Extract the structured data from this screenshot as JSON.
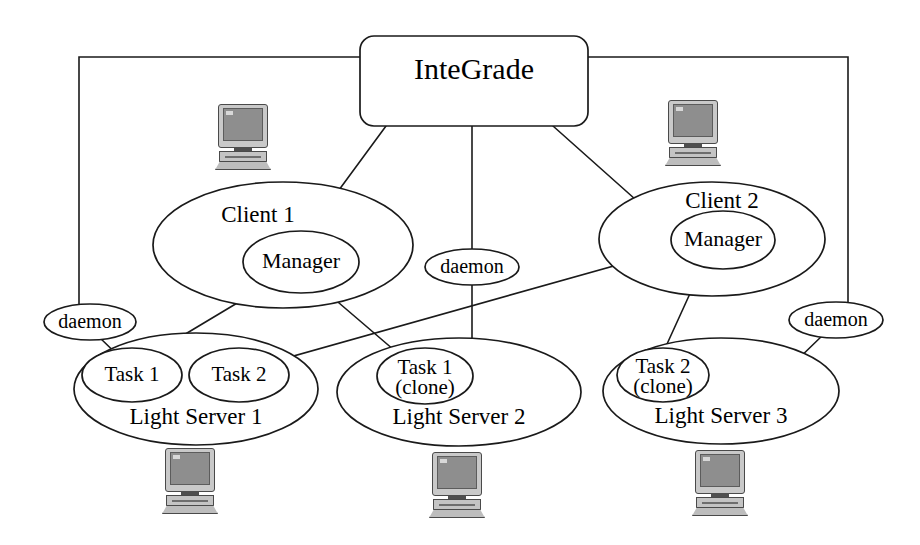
{
  "diagram": {
    "title": "InteGrade",
    "root": {
      "label": "InteGrade",
      "shape": "rounded-rectangle"
    },
    "clients": [
      {
        "id": "client-1",
        "label": "Client 1",
        "manager_label": "Manager"
      },
      {
        "id": "client-2",
        "label": "Client 2",
        "manager_label": "Manager"
      }
    ],
    "light_servers": [
      {
        "id": "light-server-1",
        "label": "Light Server 1",
        "tasks": [
          {
            "id": "task-1",
            "line1": "Task 1",
            "line2": ""
          },
          {
            "id": "task-2",
            "line1": "Task 2",
            "line2": ""
          }
        ]
      },
      {
        "id": "light-server-2",
        "label": "Light Server 2",
        "tasks": [
          {
            "id": "task-1-clone",
            "line1": "Task 1",
            "line2": "(clone)"
          }
        ]
      },
      {
        "id": "light-server-3",
        "label": "Light Server 3",
        "tasks": [
          {
            "id": "task-2-clone",
            "line1": "Task 2",
            "line2": "(clone)"
          }
        ]
      }
    ],
    "daemons": [
      {
        "id": "daemon-left",
        "label": "daemon"
      },
      {
        "id": "daemon-center",
        "label": "daemon"
      },
      {
        "id": "daemon-right",
        "label": "daemon"
      }
    ],
    "computers": [
      {
        "id": "computer-client-1"
      },
      {
        "id": "computer-client-2"
      },
      {
        "id": "computer-light-server-1"
      },
      {
        "id": "computer-light-server-2"
      },
      {
        "id": "computer-light-server-3"
      }
    ],
    "colors": {
      "stroke": "#1a1a1a",
      "background": "#ffffff",
      "icon_screen": "#8e8e8e",
      "icon_body": "#c9c9c9"
    }
  }
}
